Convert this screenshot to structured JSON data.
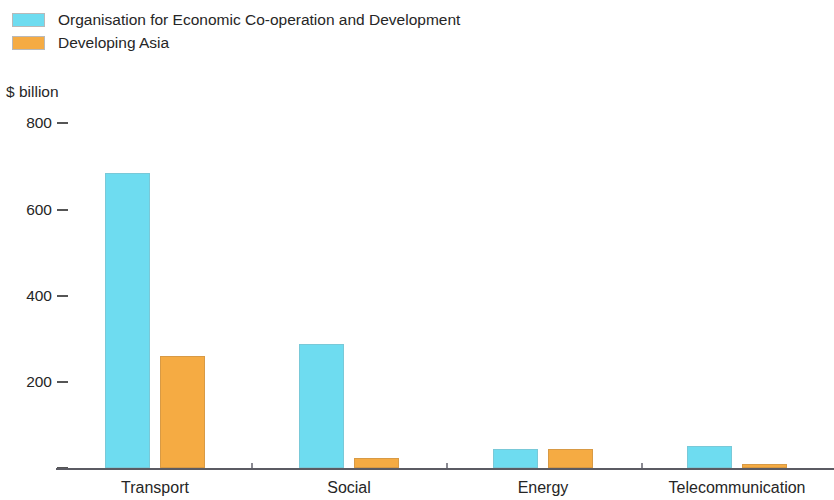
{
  "chart_data": {
    "type": "bar",
    "title": "",
    "subtitle": "",
    "xlabel": "",
    "ylabel": "$ billion",
    "ylim": [
      0,
      800
    ],
    "yticks": [
      0,
      200,
      400,
      600,
      800
    ],
    "ytick_labels": [
      "",
      "200",
      "400",
      "600",
      "800"
    ],
    "grid": false,
    "legend_position": "top-left",
    "categories": [
      "Transport",
      "Social",
      "Energy",
      "Telecommunication"
    ],
    "series": [
      {
        "name": "Organisation for Economic Co-operation and Development",
        "color": "#6edcf0",
        "values": [
          685,
          287,
          45,
          52
        ]
      },
      {
        "name": "Developing Asia",
        "color": "#f5ab43",
        "values": [
          260,
          23,
          45,
          10
        ]
      }
    ]
  },
  "legend": {
    "items": [
      {
        "label": "Organisation for Economic Co-operation and Development",
        "color": "#6edcf0"
      },
      {
        "label": "Developing Asia",
        "color": "#f5ab43"
      }
    ]
  },
  "axis": {
    "unit_caption": "$ billion",
    "y_tick_labels": [
      "800",
      "600",
      "400",
      "200",
      ""
    ],
    "x_tick_labels": [
      "Transport",
      "Social",
      "Energy",
      "Telecommunication"
    ]
  }
}
